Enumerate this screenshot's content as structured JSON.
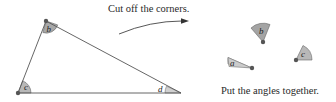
{
  "diagram": {
    "instruction_top": "Cut off the corners.",
    "instruction_bottom": "Put the angles together.",
    "triangle": {
      "vertices": {
        "b": {
          "label": "b",
          "x": 46,
          "y": 21
        },
        "c": {
          "label": "c",
          "x": 18,
          "y": 93
        },
        "d": {
          "label": "d",
          "x": 181,
          "y": 93
        }
      }
    },
    "pieces": [
      {
        "label": "b",
        "cx": 263,
        "cy": 42
      },
      {
        "label": "c",
        "cx": 296,
        "cy": 60
      },
      {
        "label": "a",
        "cx": 252,
        "cy": 68
      }
    ],
    "colors": {
      "line": "#555555",
      "angle_fill": "#b5b5b5",
      "angle_fill_dark": "#9a9a9a",
      "dot": "#555555",
      "text": "#2a2a2a"
    }
  }
}
